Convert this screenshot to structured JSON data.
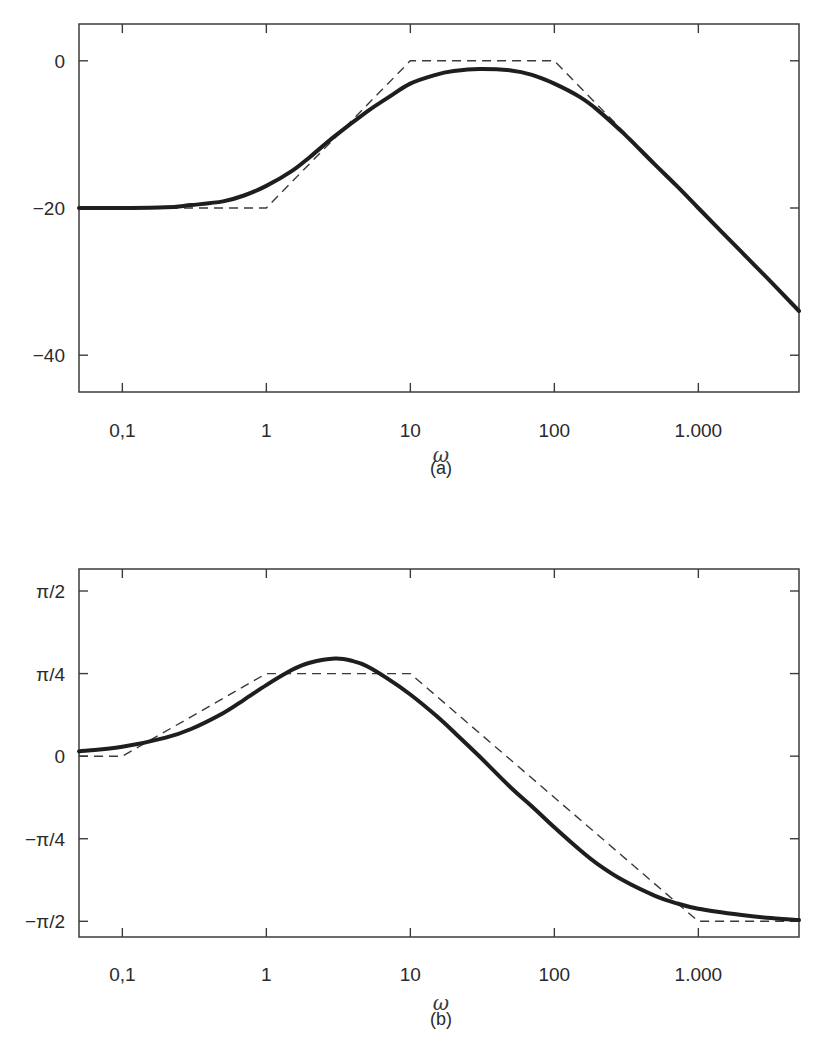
{
  "chart_data": [
    {
      "type": "line",
      "panel": "(a)",
      "title": "",
      "xlabel": "ω",
      "ylabel": "",
      "xscale": "log",
      "xlim": [
        0.05,
        5000
      ],
      "ylim": [
        -45,
        5
      ],
      "grid": false,
      "xticks": [
        {
          "value": 0.1,
          "label": "0,1"
        },
        {
          "value": 1,
          "label": "1"
        },
        {
          "value": 10,
          "label": "10"
        },
        {
          "value": 100,
          "label": "100"
        },
        {
          "value": 1000,
          "label": "1.000"
        }
      ],
      "yticks": [
        {
          "value": 0,
          "label": "0"
        },
        {
          "value": -20,
          "label": "−20"
        },
        {
          "value": -40,
          "label": "−40"
        }
      ],
      "series": [
        {
          "name": "exact magnitude (dB)",
          "style": "solid-thick",
          "x": [
            0.05,
            0.1,
            0.2,
            0.3,
            0.5,
            0.7,
            1,
            1.5,
            2,
            3,
            5,
            7,
            10,
            15,
            20,
            30,
            50,
            70,
            100,
            150,
            200,
            300,
            500,
            700,
            1000,
            2000,
            3000,
            5000
          ],
          "y": [
            -20.0,
            -20.0,
            -19.9,
            -19.6,
            -19.1,
            -18.3,
            -17.0,
            -15.0,
            -13.1,
            -10.2,
            -6.9,
            -5.0,
            -3.1,
            -1.9,
            -1.4,
            -1.1,
            -1.3,
            -1.9,
            -3.1,
            -4.9,
            -6.7,
            -9.8,
            -14.1,
            -16.9,
            -20.0,
            -26.0,
            -29.5,
            -34.0
          ]
        },
        {
          "name": "asymptotic approximation (dB)",
          "style": "dashed",
          "x": [
            0.05,
            1,
            10,
            100,
            5000
          ],
          "y": [
            -20,
            -20,
            0,
            0,
            -34
          ]
        }
      ]
    },
    {
      "type": "line",
      "panel": "(b)",
      "title": "",
      "xlabel": "ω",
      "ylabel": "",
      "xscale": "log",
      "xlim": [
        0.05,
        5000
      ],
      "ylim": [
        -1.72,
        1.78
      ],
      "grid": false,
      "xticks": [
        {
          "value": 0.1,
          "label": "0,1"
        },
        {
          "value": 1,
          "label": "1"
        },
        {
          "value": 10,
          "label": "10"
        },
        {
          "value": 100,
          "label": "100"
        },
        {
          "value": 1000,
          "label": "1.000"
        }
      ],
      "yticks": [
        {
          "value": 1.5708,
          "label": "π/2"
        },
        {
          "value": 0.7854,
          "label": "π/4"
        },
        {
          "value": 0,
          "label": "0"
        },
        {
          "value": -0.7854,
          "label": "−π/4"
        },
        {
          "value": -1.5708,
          "label": "−π/2"
        }
      ],
      "series": [
        {
          "name": "exact phase (rad)",
          "style": "solid-thick",
          "x": [
            0.05,
            0.1,
            0.2,
            0.3,
            0.5,
            0.7,
            1,
            1.5,
            2,
            3,
            4,
            5,
            7,
            10,
            15,
            20,
            30,
            50,
            70,
            100,
            150,
            200,
            300,
            500,
            700,
            1000,
            2000,
            3000,
            5000
          ],
          "y": [
            0.045,
            0.089,
            0.176,
            0.258,
            0.409,
            0.536,
            0.676,
            0.818,
            0.888,
            0.928,
            0.904,
            0.856,
            0.735,
            0.586,
            0.389,
            0.232,
            0.001,
            -0.301,
            -0.479,
            -0.677,
            -0.891,
            -1.027,
            -1.181,
            -1.328,
            -1.398,
            -1.451,
            -1.511,
            -1.537,
            -1.559
          ]
        },
        {
          "name": "asymptotic approximation (rad)",
          "style": "dashed",
          "x": [
            0.05,
            0.1,
            1,
            10,
            1000,
            5000
          ],
          "y": [
            0,
            0,
            0.7854,
            0.7854,
            -1.5708,
            -1.5708
          ]
        }
      ]
    }
  ],
  "panels": [
    {
      "caption": "(a)",
      "xlabel": "ω"
    },
    {
      "caption": "(b)",
      "xlabel": "ω"
    }
  ],
  "colors": {
    "curve": "#1e1e1e",
    "dashed": "#3a3a3a",
    "frame": "#3c3c3c"
  }
}
